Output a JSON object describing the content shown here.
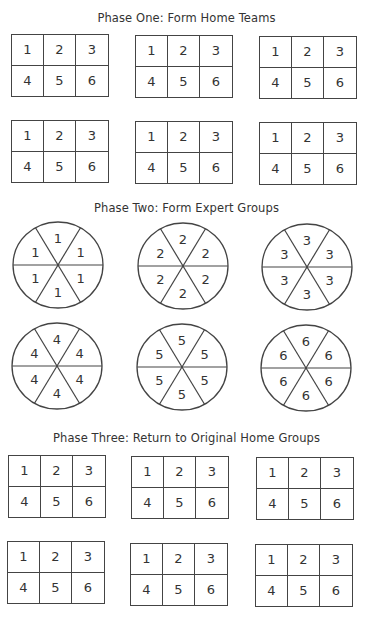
{
  "phases": [
    {
      "title": "Phase One: Form Home Teams",
      "type": "home-teams"
    },
    {
      "title": "Phase Two: Form Expert Groups",
      "type": "expert-groups"
    },
    {
      "title": "Phase Three: Return to Original Home Groups",
      "type": "home-teams"
    }
  ],
  "home_team_cells": [
    "1",
    "2",
    "3",
    "4",
    "5",
    "6"
  ],
  "expert_groups": [
    {
      "label": "1"
    },
    {
      "label": "2"
    },
    {
      "label": "3"
    },
    {
      "label": "4"
    },
    {
      "label": "5"
    },
    {
      "label": "6"
    }
  ],
  "colors": {
    "line": "#444444",
    "text": "#333333",
    "background": "#ffffff"
  }
}
